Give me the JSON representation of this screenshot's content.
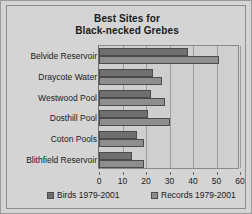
{
  "chart_data": {
    "type": "bar",
    "orientation": "horizontal",
    "title": "Best Sites for Black-necked Grebes",
    "title_lines": [
      "Best Sites for",
      "Black-necked Grebes"
    ],
    "categories": [
      "Belvide Reservoir",
      "Draycote Water",
      "Westwood Pool",
      "Dosthill Pool",
      "Coton Pools",
      "Blithfield Reservoir"
    ],
    "series": [
      {
        "name": "Birds 1979-2001",
        "color": "#6f6f6f",
        "values": [
          38,
          23,
          22,
          21,
          16,
          14
        ]
      },
      {
        "name": "Records 1979-2001",
        "color": "#8e8e8e",
        "values": [
          51,
          27,
          28,
          30,
          19,
          19
        ]
      }
    ],
    "xlabel": "",
    "ylabel": "",
    "xlim": [
      0,
      60
    ],
    "xticks": [
      0,
      10,
      20,
      30,
      40,
      50,
      60
    ],
    "xtick_labels": [
      "0",
      "10",
      "20",
      "30",
      "40",
      "50",
      "60"
    ],
    "grid": true,
    "grid_axis": "x",
    "legend_position": "bottom",
    "plot_background": "#cfcfcf",
    "figure_background": "#d4d4d4"
  }
}
